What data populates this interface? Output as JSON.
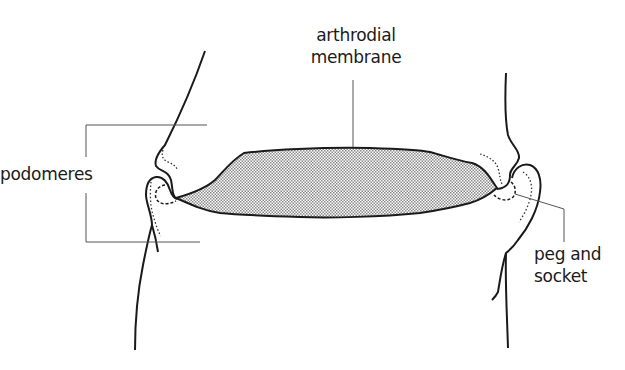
{
  "diagram": {
    "type": "labeled anatomical line drawing",
    "labels": {
      "arthrodial_line1": "arthrodial",
      "arthrodial_line2": "membrane",
      "podomeres": "podomeres",
      "peg_line1": "peg and",
      "peg_line2": "socket"
    },
    "parts": [
      {
        "id": "arthrodial-membrane",
        "label": "arthrodial membrane",
        "style": "stippled fill"
      },
      {
        "id": "podomere-upper",
        "label": "podomeres"
      },
      {
        "id": "podomere-lower",
        "label": "podomeres"
      },
      {
        "id": "peg-and-socket",
        "label": "peg and socket",
        "style": "dashed/dotted outline"
      }
    ],
    "colors": {
      "ink": "#1a1a1a",
      "leader": "#555555",
      "stipple": "#9a9a9a",
      "background": "#ffffff"
    }
  }
}
